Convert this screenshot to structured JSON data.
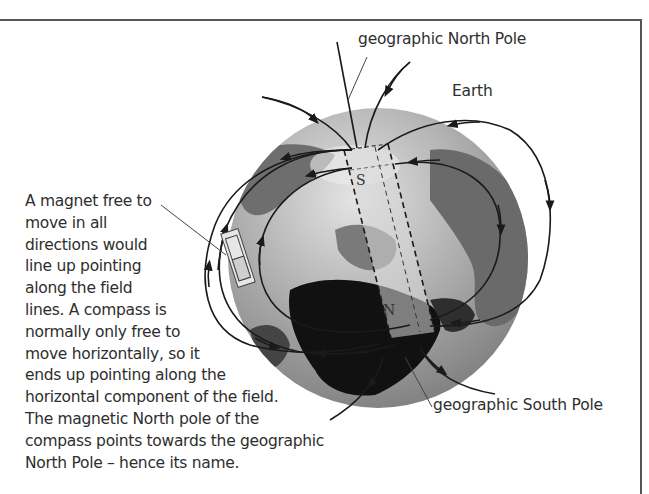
{
  "labels": {
    "north_pole": "geographic North Pole",
    "south_pole": "geographic South Pole",
    "earth": "Earth",
    "magnet_south": "S",
    "magnet_north": "N"
  },
  "caption": {
    "lines": [
      "A magnet free to",
      "move in all",
      "directions would",
      "line up pointing",
      "along the field",
      "lines. A compass is",
      "normally only free to",
      "move horizontally, so it",
      "ends up pointing along the",
      "horizontal component of the field.",
      "The magnetic North pole of the",
      "compass points towards the geographic",
      "North Pole – hence its name."
    ]
  },
  "colors": {
    "frame": "#555555",
    "ocean": "#9a9a9a",
    "land_dark": "#5a5a5a",
    "land_black": "#111111",
    "field_line": "#1a1a1a"
  }
}
